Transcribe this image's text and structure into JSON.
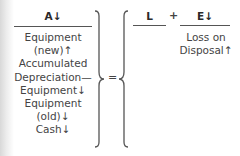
{
  "equation": {
    "assets": {
      "header": "A↓",
      "items": [
        "Equipment",
        "(new)↑",
        "Accumulated",
        "Depreciation—",
        "Equipment↓",
        "Equipment",
        "(old)↓",
        "Cash↓"
      ]
    },
    "equals": "=",
    "liabilities": {
      "header": "L",
      "items": []
    },
    "plus": "+",
    "equity": {
      "header": "E↓",
      "items": [
        "Loss on",
        "Disposal↑"
      ]
    }
  }
}
